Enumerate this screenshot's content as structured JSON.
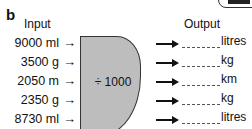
{
  "section_label": "b",
  "headers": {
    "input": "Input",
    "output": "Output"
  },
  "operation": "÷ 1000",
  "arrow_glyph": "→",
  "rows": [
    {
      "input": "9000 ml",
      "output_unit": "litres"
    },
    {
      "input": "3500 g",
      "output_unit": "kg"
    },
    {
      "input": "2050 m",
      "output_unit": "km"
    },
    {
      "input": "2350 g",
      "output_unit": "kg"
    },
    {
      "input": "8730 ml",
      "output_unit": "litres"
    }
  ],
  "colors": {
    "machine_fill": "#bdbdbd",
    "ink": "#111111"
  }
}
